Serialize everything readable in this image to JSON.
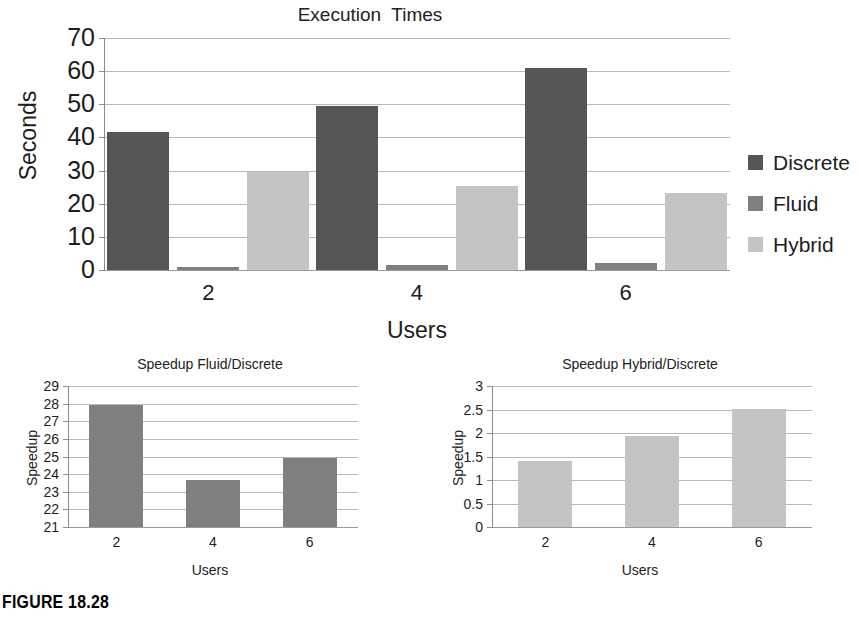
{
  "figure": {
    "caption": "FIGURE 18.28"
  },
  "colors": {
    "discrete": "#555555",
    "fluid": "#7f7f7f",
    "hybrid": "#c4c4c4",
    "gridline": "#b9b9b9",
    "axis": "#8c8c8c",
    "text": "#1d1d1d",
    "background": "#ffffff"
  },
  "chart_data": [
    {
      "id": "execution-times",
      "type": "bar",
      "title": "Execution  Times",
      "xlabel": "Users",
      "ylabel": "Seconds",
      "categories": [
        "2",
        "4",
        "6"
      ],
      "ylim": [
        0,
        70
      ],
      "yticks": [
        0,
        10,
        20,
        30,
        40,
        50,
        60,
        70
      ],
      "ytick_labels": [
        "0",
        "10",
        "20",
        "30",
        "40",
        "50",
        "60",
        "70"
      ],
      "grid": true,
      "legend_position": "right",
      "series": [
        {
          "name": "Discrete",
          "color": "#555555",
          "values": [
            41.5,
            49.5,
            61.0
          ]
        },
        {
          "name": "Fluid",
          "color": "#7f7f7f",
          "values": [
            1.0,
            1.5,
            2.0
          ]
        },
        {
          "name": "Hybrid",
          "color": "#c4c4c4",
          "values": [
            29.5,
            25.3,
            23.2
          ]
        }
      ]
    },
    {
      "id": "speedup-fluid-discrete",
      "type": "bar",
      "title": "Speedup Fluid/Discrete",
      "xlabel": "Users",
      "ylabel": "Speedup",
      "categories": [
        "2",
        "4",
        "6"
      ],
      "ylim": [
        21,
        29
      ],
      "yticks": [
        21,
        22,
        23,
        24,
        25,
        26,
        27,
        28,
        29
      ],
      "ytick_labels": [
        "21",
        "22",
        "23",
        "24",
        "25",
        "26",
        "27",
        "28",
        "29"
      ],
      "grid": true,
      "series": [
        {
          "name": "Speedup Fluid/Discrete",
          "color": "#7f7f7f",
          "values": [
            27.9,
            23.65,
            24.9
          ]
        }
      ]
    },
    {
      "id": "speedup-hybrid-discrete",
      "type": "bar",
      "title": "Speedup Hybrid/Discrete",
      "xlabel": "Users",
      "ylabel": "Speedup",
      "categories": [
        "2",
        "4",
        "6"
      ],
      "ylim": [
        0,
        3
      ],
      "yticks": [
        0,
        0.5,
        1,
        1.5,
        2,
        2.5,
        3
      ],
      "ytick_labels": [
        "0",
        "0.5",
        "1",
        "1.5",
        "2",
        "2.5",
        "3"
      ],
      "grid": true,
      "series": [
        {
          "name": "Speedup Hybrid/Discrete",
          "color": "#c4c4c4",
          "values": [
            1.4,
            1.93,
            2.52
          ]
        }
      ]
    }
  ]
}
